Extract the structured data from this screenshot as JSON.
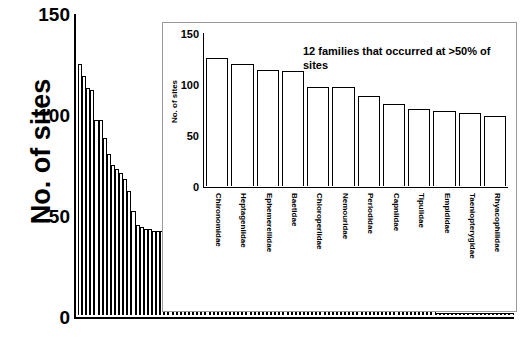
{
  "chart_data": [
    {
      "id": "main",
      "type": "bar",
      "title": "",
      "xlabel": "",
      "ylabel": "No. of sites",
      "ylim": [
        0,
        150
      ],
      "yticks": [
        0,
        50,
        100,
        150
      ],
      "grid": false,
      "legend": "none",
      "description": "Rank-ordered number of sites at which each invertebrate family occurred",
      "categories": [
        "1",
        "2",
        "3",
        "4",
        "5",
        "6",
        "7",
        "8",
        "9",
        "10",
        "11",
        "12",
        "13",
        "14",
        "15",
        "16",
        "17",
        "18",
        "19",
        "20",
        "21",
        "22",
        "23",
        "24",
        "25",
        "26",
        "27",
        "28",
        "29",
        "30",
        "31",
        "32",
        "33",
        "34",
        "35",
        "36",
        "37",
        "38",
        "39",
        "40",
        "41",
        "42",
        "43",
        "44",
        "45",
        "46",
        "47",
        "48",
        "49",
        "50",
        "51",
        "52",
        "53",
        "54",
        "55",
        "56",
        "57",
        "58",
        "59",
        "60",
        "61",
        "62",
        "63",
        "64",
        "65",
        "66",
        "67",
        "68",
        "69",
        "70",
        "71",
        "72",
        "73",
        "74",
        "75",
        "76",
        "77",
        "78",
        "79",
        "80",
        "81",
        "82",
        "83",
        "84",
        "85",
        "86",
        "87",
        "88",
        "89",
        "90",
        "91",
        "92",
        "93",
        "94",
        "95",
        "96",
        "97",
        "98",
        "99",
        "100",
        "101",
        "102",
        "103",
        "104",
        "105",
        "106"
      ],
      "values": [
        125,
        119,
        113,
        112,
        97,
        97,
        88,
        80,
        75,
        73,
        71,
        68,
        62,
        52,
        45,
        44,
        43,
        43,
        42,
        42,
        42,
        41,
        41,
        41,
        41,
        40,
        40,
        40,
        40,
        39,
        39,
        38,
        33,
        31,
        30,
        26,
        25,
        24,
        24,
        23,
        23,
        23,
        22,
        21,
        20,
        19,
        18,
        17,
        16,
        15,
        14,
        13,
        13,
        12,
        11,
        10,
        10,
        9,
        9,
        8,
        8,
        8,
        7,
        7,
        6,
        6,
        6,
        5,
        5,
        5,
        4,
        4,
        4,
        4,
        3,
        3,
        3,
        3,
        3,
        2,
        2,
        2,
        2,
        2,
        2,
        2,
        2,
        1,
        1,
        1,
        1,
        1,
        1,
        1,
        1,
        1,
        1,
        1,
        1,
        1,
        1,
        1,
        1,
        1,
        1,
        1
      ]
    },
    {
      "id": "inset",
      "type": "bar",
      "title": "",
      "annotation": "12 families that occurred at >50% of sites",
      "xlabel": "",
      "ylabel": "No. of sites",
      "ylim": [
        0,
        150
      ],
      "yticks": [
        0,
        50,
        100,
        150
      ],
      "grid": false,
      "legend": "none",
      "categories": [
        "Chironomidae",
        "Heptageniidae",
        "Ephemerellidae",
        "Baetidae",
        "Chloroperlidae",
        "Nemouridae",
        "Perlodidae",
        "Capniidae",
        "Tipulidae",
        "Empididae",
        "Taeniopterygidae",
        "Rhyacophilidae"
      ],
      "values": [
        125,
        119,
        113,
        112,
        97,
        97,
        88,
        80,
        75,
        73,
        71,
        68
      ]
    }
  ],
  "main": {
    "ylabel": "No. of sites",
    "yticks": [
      "150",
      "100",
      "50",
      "0"
    ]
  },
  "inset": {
    "ylabel": "No. of sites",
    "yticks": [
      "150",
      "100",
      "50",
      "0"
    ],
    "annotation": "12 families that occurred at >50% of sites"
  }
}
